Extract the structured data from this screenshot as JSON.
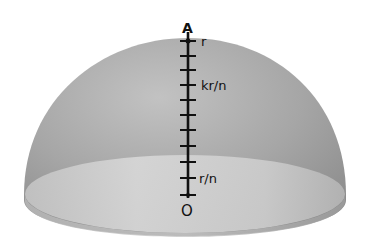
{
  "figure": {
    "type": "hemisphere-with-axis",
    "colors": {
      "background": "#ffffff",
      "dome_shell": "#a9a9a9",
      "dome_shell_dark": "#8c8c8c",
      "base_disk": "#cfcfcf",
      "axis": "#111111"
    },
    "points": {
      "top": "A",
      "bottom": "O"
    },
    "tick_labels": {
      "top": "r",
      "middle": "kr/n",
      "bottom": "r/n"
    },
    "tick_count": 11
  }
}
